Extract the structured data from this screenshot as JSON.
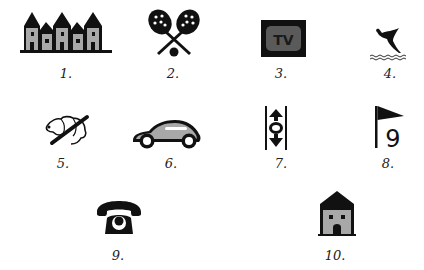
{
  "figure": {
    "items": [
      {
        "number": "1.",
        "icon": "town-houses-icon"
      },
      {
        "number": "2.",
        "icon": "tennis-rackets-icon"
      },
      {
        "number": "3.",
        "icon": "tv-icon"
      },
      {
        "number": "4.",
        "icon": "diver-water-icon"
      },
      {
        "number": "5.",
        "icon": "no-dogs-icon"
      },
      {
        "number": "6.",
        "icon": "car-icon"
      },
      {
        "number": "7.",
        "icon": "elevator-icon"
      },
      {
        "number": "8.",
        "icon": "golf-flag-9-icon"
      },
      {
        "number": "9.",
        "icon": "telephone-icon"
      },
      {
        "number": "10.",
        "icon": "house-icon"
      }
    ],
    "icon_text": {
      "tv": "TV",
      "golf_number": "9"
    },
    "colors": {
      "ink": "#111111",
      "gray_fill": "#a8a8a8",
      "tv_screen": "#5a5a5a",
      "tv_text": "#1a1a1a"
    }
  }
}
